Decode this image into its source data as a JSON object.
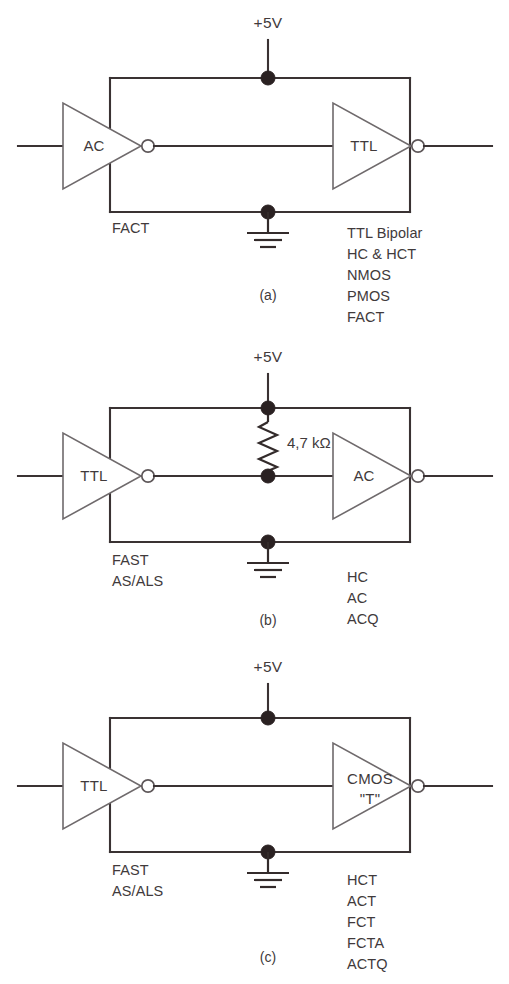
{
  "figure": {
    "type": "circuit-diagram",
    "supply_label": "+5V",
    "colors": {
      "wire": "#332b2b",
      "gate_outline": "#6f6a6c",
      "junction": "#2a2122",
      "text": "#413a3b",
      "background": "#ffffff"
    }
  },
  "panels": [
    {
      "caption": "(a)",
      "supply_label": "+5V",
      "driver_gate": "AC",
      "load_gate": "TTL",
      "left_note": "FACT",
      "resistor": null,
      "family_list": [
        "TTL Bipolar",
        "HC & HCT",
        "NMOS",
        "PMOS",
        "FACT"
      ]
    },
    {
      "caption": "(b)",
      "supply_label": "+5V",
      "driver_gate": "TTL",
      "load_gate": "AC",
      "left_note_line1": "FAST",
      "left_note_line2": "AS/ALS",
      "resistor": "4,7 kΩ",
      "family_list": [
        "HC",
        "AC",
        "ACQ"
      ]
    },
    {
      "caption": "(c)",
      "supply_label": "+5V",
      "driver_gate": "TTL",
      "load_gate_line1": "CMOS",
      "load_gate_line2": "\"T\"",
      "left_note_line1": "FAST",
      "left_note_line2": "AS/ALS",
      "resistor": null,
      "family_list": [
        "HCT",
        "ACT",
        "FCT",
        "FCTA",
        "ACTQ"
      ]
    }
  ]
}
